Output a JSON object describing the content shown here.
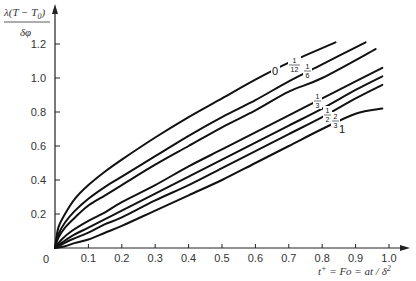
{
  "chart_data": {
    "type": "line",
    "title": "",
    "ylabel": "λ(T − T0) / δφ",
    "ylabel_numerator": "λ(T − T",
    "ylabel_sub": "0",
    "ylabel_close": ")",
    "ylabel_denominator": "δφ",
    "xlabel": "t⁺ = Fo = at / δ²",
    "xlim": [
      0,
      1.0
    ],
    "ylim": [
      0,
      1.3
    ],
    "grid": false,
    "legend": "inline curve labels",
    "x_ticks": [
      "0",
      "0.1",
      "0.2",
      "0.3",
      "0.4",
      "0.5",
      "0.6",
      "0.7",
      "0.8",
      "0.9",
      "1.0"
    ],
    "y_ticks": [
      "0.2",
      "0.4",
      "0.6",
      "0.8",
      "1.0",
      "1.2"
    ],
    "series": [
      {
        "name": "0",
        "label_num": "",
        "label_den": "",
        "label": "0",
        "x": [
          0,
          0.01,
          0.03,
          0.06,
          0.1,
          0.15,
          0.2,
          0.3,
          0.4,
          0.5,
          0.6,
          0.7,
          0.84
        ],
        "y": [
          0,
          0.12,
          0.2,
          0.29,
          0.37,
          0.45,
          0.52,
          0.65,
          0.77,
          0.88,
          0.99,
          1.09,
          1.21
        ]
      },
      {
        "name": "1/12",
        "label": "1/12",
        "x": [
          0,
          0.01,
          0.03,
          0.06,
          0.1,
          0.15,
          0.2,
          0.3,
          0.4,
          0.5,
          0.6,
          0.7,
          0.8,
          0.93
        ],
        "y": [
          0,
          0.08,
          0.15,
          0.22,
          0.29,
          0.36,
          0.42,
          0.54,
          0.66,
          0.77,
          0.87,
          0.98,
          1.08,
          1.21
        ]
      },
      {
        "name": "1/6",
        "label": "1/6",
        "x": [
          0,
          0.01,
          0.03,
          0.06,
          0.1,
          0.15,
          0.2,
          0.3,
          0.4,
          0.5,
          0.6,
          0.7,
          0.8,
          0.96
        ],
        "y": [
          0,
          0.06,
          0.12,
          0.18,
          0.25,
          0.31,
          0.37,
          0.49,
          0.6,
          0.71,
          0.81,
          0.92,
          1.0,
          1.17
        ]
      },
      {
        "name": "1/3",
        "label": "1/3",
        "x": [
          0,
          0.02,
          0.05,
          0.1,
          0.15,
          0.2,
          0.3,
          0.4,
          0.5,
          0.6,
          0.7,
          0.8,
          0.9,
          0.98
        ],
        "y": [
          0,
          0.05,
          0.1,
          0.16,
          0.21,
          0.27,
          0.37,
          0.48,
          0.58,
          0.68,
          0.78,
          0.88,
          0.98,
          1.06
        ]
      },
      {
        "name": "1/2",
        "label": "1/2",
        "x": [
          0,
          0.02,
          0.05,
          0.1,
          0.15,
          0.2,
          0.3,
          0.4,
          0.5,
          0.6,
          0.7,
          0.8,
          0.9,
          0.98
        ],
        "y": [
          0,
          0.03,
          0.07,
          0.12,
          0.17,
          0.22,
          0.32,
          0.42,
          0.52,
          0.62,
          0.72,
          0.82,
          0.93,
          1.01
        ]
      },
      {
        "name": "2/3",
        "label": "2/3",
        "x": [
          0,
          0.02,
          0.05,
          0.1,
          0.15,
          0.2,
          0.3,
          0.4,
          0.5,
          0.6,
          0.7,
          0.8,
          0.9,
          0.98
        ],
        "y": [
          0,
          0.02,
          0.05,
          0.09,
          0.14,
          0.18,
          0.28,
          0.37,
          0.47,
          0.57,
          0.67,
          0.77,
          0.88,
          0.96
        ]
      },
      {
        "name": "1",
        "label": "1",
        "x": [
          0,
          0.03,
          0.06,
          0.1,
          0.15,
          0.2,
          0.3,
          0.4,
          0.5,
          0.6,
          0.7,
          0.8,
          0.9,
          0.98
        ],
        "y": [
          0,
          0.01,
          0.03,
          0.05,
          0.09,
          0.13,
          0.22,
          0.31,
          0.4,
          0.5,
          0.6,
          0.7,
          0.79,
          0.82
        ]
      }
    ]
  },
  "curve_labels": [
    {
      "id": "0",
      "text": "0",
      "x": 272,
      "y": 75,
      "type": "plain"
    },
    {
      "id": "1/12",
      "num": "1",
      "den": "12",
      "x": 289,
      "y": 64,
      "type": "frac"
    },
    {
      "id": "1/6",
      "num": "1",
      "den": "6",
      "x": 304,
      "y": 70,
      "type": "frac"
    },
    {
      "id": "1/3",
      "num": "1",
      "den": "3",
      "x": 314,
      "y": 100,
      "type": "frac"
    },
    {
      "id": "1/2",
      "num": "1",
      "den": "2",
      "x": 324,
      "y": 114,
      "type": "frac"
    },
    {
      "id": "2/3",
      "num": "2",
      "den": "3",
      "x": 332,
      "y": 120,
      "type": "frac"
    },
    {
      "id": "1",
      "text": "1",
      "x": 339,
      "y": 133,
      "type": "plain"
    }
  ],
  "axes": {
    "x_label_parts": {
      "t": "t",
      "sup": "+",
      "rest": " = Fo = at / δ",
      "sup2": "2"
    },
    "origin_label": "0"
  }
}
